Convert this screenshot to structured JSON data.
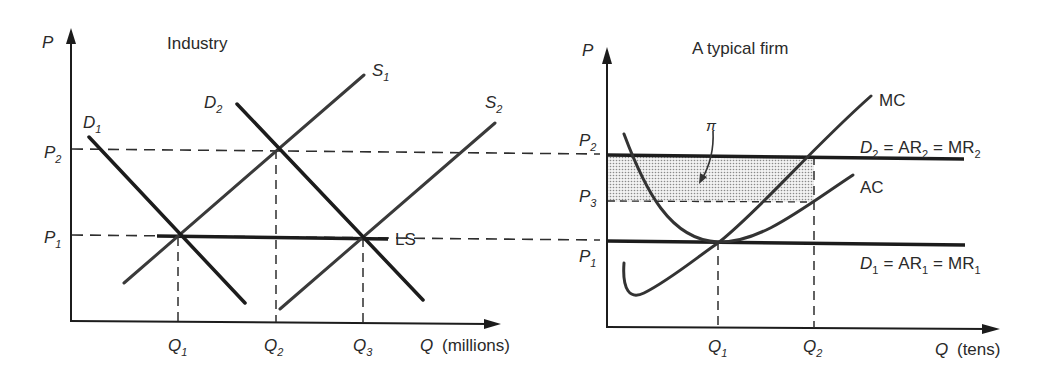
{
  "colors": {
    "ink": "#1c1c1c",
    "curve": "#333333",
    "dash": "#2e2e2e",
    "shade": "#bdbdbd"
  },
  "industry": {
    "title": "Industry",
    "y_axis_label": "P",
    "x_axis_label": "Q",
    "x_axis_unit": "(millions)",
    "price_ticks": [
      {
        "base": "P",
        "sub": "2"
      },
      {
        "base": "P",
        "sub": "1"
      }
    ],
    "quantity_ticks": [
      {
        "base": "Q",
        "sub": "1"
      },
      {
        "base": "Q",
        "sub": "2"
      },
      {
        "base": "Q",
        "sub": "3"
      }
    ],
    "curves": {
      "D1": {
        "base": "D",
        "sub": "1"
      },
      "D2": {
        "base": "D",
        "sub": "2"
      },
      "S1": {
        "base": "S",
        "sub": "1"
      },
      "S2": {
        "base": "S",
        "sub": "2"
      },
      "LS": {
        "base": "LS"
      }
    }
  },
  "firm": {
    "title": "A typical firm",
    "y_axis_label": "P",
    "x_axis_label": "Q",
    "x_axis_unit": "(tens)",
    "price_ticks": [
      {
        "base": "P",
        "sub": "2"
      },
      {
        "base": "P",
        "sub": "3"
      },
      {
        "base": "P",
        "sub": "1"
      }
    ],
    "quantity_ticks": [
      {
        "base": "Q",
        "sub": "1"
      },
      {
        "base": "Q",
        "sub": "2"
      }
    ],
    "curves": {
      "MC": "MC",
      "AC": "AC"
    },
    "demand2": {
      "d": "D",
      "d_sub": "2",
      "ar": "AR",
      "ar_sub": "2",
      "mr": "MR",
      "mr_sub": "2",
      "eq": "="
    },
    "demand1": {
      "d": "D",
      "d_sub": "1",
      "ar": "AR",
      "ar_sub": "1",
      "mr": "MR",
      "mr_sub": "1",
      "eq": "="
    },
    "profit_label": "π"
  }
}
